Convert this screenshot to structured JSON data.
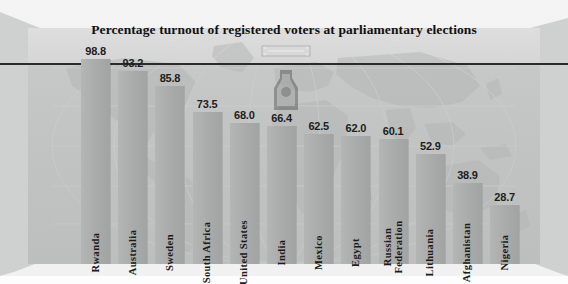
{
  "chart_data": {
    "type": "bar",
    "title": "Percentage turnout of registered voters at parliamentary elections",
    "xlabel": "",
    "ylabel": "",
    "ylim": [
      0,
      110
    ],
    "grid": false,
    "legend": null,
    "categories": [
      "Rwanda",
      "Australia",
      "Sweden",
      "South Africa",
      "United States",
      "India",
      "Mexico",
      "Egypt",
      "Russian Federation",
      "Lithuania",
      "Afghanistan",
      "Nigeria"
    ],
    "values": [
      98.8,
      93.2,
      85.8,
      73.5,
      68.0,
      66.4,
      62.5,
      62.0,
      60.1,
      52.9,
      38.9,
      28.7
    ],
    "value_labels": [
      "98.8",
      "93.2",
      "85.8",
      "73.5",
      "68.0",
      "66.4",
      "62.5",
      "62.0",
      "60.1",
      "52.9",
      "38.9",
      "28.7"
    ],
    "annotations": [
      {
        "name": "reference-rule",
        "kind": "horizontal-line",
        "description": "dark horizontal rule across plot near top"
      }
    ]
  },
  "colors": {
    "bar": "#a9abaa",
    "plot_background": "#c2c4c3",
    "panel_top": "#d7d8d7",
    "rule": "#2b2b2b",
    "text": "#1b1b1b",
    "page_background": "#fdfdfd"
  },
  "figure": {
    "title": "Percentage turnout of registered voters at parliamentary elections",
    "watermark": "emblem-watermark",
    "background_graphic": "world-map-watermark"
  }
}
